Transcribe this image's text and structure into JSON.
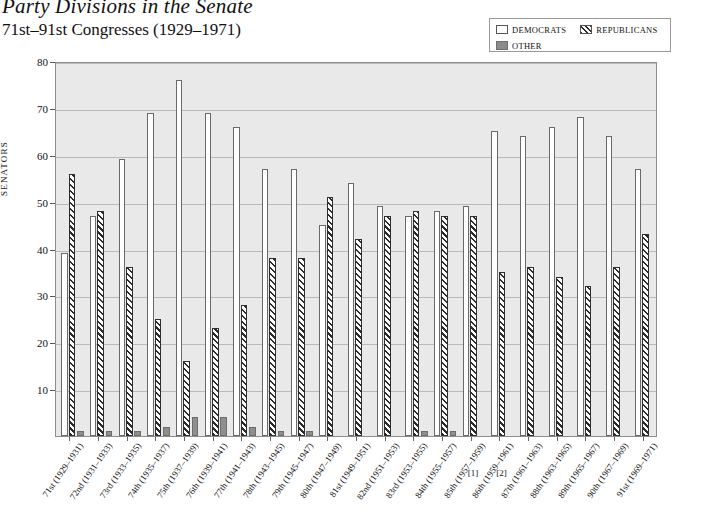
{
  "header": {
    "title": "Party Divisions in the Senate",
    "subtitle": "71st–91st Congresses (1929–1971)"
  },
  "legend": {
    "position": "top-right",
    "items": [
      {
        "label": "DEMOCRATS",
        "swatch": "democrat-swatch",
        "color": "#ffffff"
      },
      {
        "label": "REPUBLICANS",
        "swatch": "republican-swatch",
        "color": "#2b2b2b"
      },
      {
        "label": "OTHER",
        "swatch": "other-swatch",
        "color": "#8e8e8e"
      }
    ]
  },
  "footnotes": [
    {
      "marker": "[1]",
      "under": "85th (1957–1959)"
    },
    {
      "marker": "[2]",
      "under": "86th (1959–1961)"
    }
  ],
  "chart_data": {
    "type": "bar",
    "title": "Party Divisions in the Senate",
    "subtitle": "71st–91st Congresses (1929–1971)",
    "xlabel": "",
    "ylabel": "SENATORS",
    "ylim": [
      0,
      80
    ],
    "yticks": [
      0,
      10,
      20,
      30,
      40,
      50,
      60,
      70,
      80
    ],
    "ytick_labels": [
      "",
      "10",
      "20",
      "30",
      "40",
      "50",
      "60",
      "70",
      "80"
    ],
    "grid": true,
    "legend_position": "top-right",
    "categories": [
      "71st (1929–1931)",
      "72nd (1931–1933)",
      "73rd (1933–1935)",
      "74th (1935–1937)",
      "75th (1937–1939)",
      "76th (1939–1941)",
      "77th (1941–1943)",
      "78th (1943–1945)",
      "79th (1945–1947)",
      "80th (1947–1949)",
      "81st (1949–1951)",
      "82nd (1951–1953)",
      "83rd (1953–1955)",
      "84th (1955–1957)",
      "85th (1957–1959)",
      "86th (1959–1961)",
      "87th (1961–1963)",
      "88th (1963–1965)",
      "89th (1965–1967)",
      "90th (1967–1969)",
      "91st (1969–1971)"
    ],
    "series": [
      {
        "name": "DEMOCRATS",
        "values": [
          39,
          47,
          59,
          69,
          76,
          69,
          66,
          57,
          57,
          45,
          54,
          49,
          47,
          48,
          49,
          65,
          64,
          66,
          68,
          64,
          57
        ]
      },
      {
        "name": "REPUBLICANS",
        "values": [
          56,
          48,
          36,
          25,
          16,
          23,
          28,
          38,
          38,
          51,
          42,
          47,
          48,
          47,
          47,
          35,
          36,
          34,
          32,
          36,
          43
        ]
      },
      {
        "name": "OTHER",
        "values": [
          1,
          1,
          1,
          2,
          4,
          4,
          2,
          1,
          1,
          0,
          0,
          0,
          1,
          1,
          0,
          0,
          0,
          0,
          0,
          0,
          0
        ]
      }
    ]
  }
}
